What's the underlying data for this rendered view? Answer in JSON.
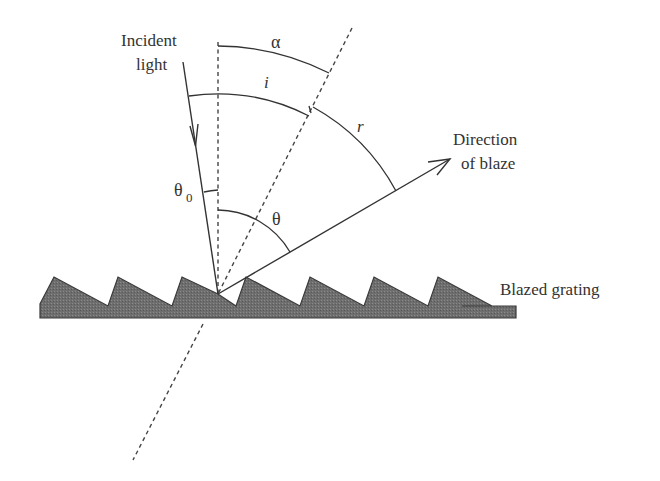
{
  "diagram": {
    "labels": {
      "incident_line1": "Incident",
      "incident_line2": "light",
      "alpha": "α",
      "i": "i",
      "r": "r",
      "theta0": "θ",
      "theta0_sub": "0",
      "theta": "θ",
      "blaze_line1": "Direction",
      "blaze_line2": "of blaze",
      "grating": "Blazed grating"
    },
    "colors": {
      "stroke": "#333333",
      "grating_fill": "#6e6e6e",
      "background": "#ffffff"
    },
    "elements": [
      "incident-light-ray",
      "grating-normal (vertical dashed)",
      "facet-normal (inclined dashed)",
      "direction-of-blaze-ray",
      "blazed-grating (sawtooth)",
      "angle arcs: alpha, i, r, theta, theta0"
    ]
  }
}
